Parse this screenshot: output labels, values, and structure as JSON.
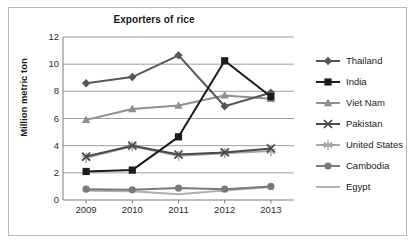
{
  "chart_data": {
    "type": "line",
    "title": "Exporters of rice",
    "xlabel": "",
    "ylabel": "Million metric ton",
    "categories": [
      "2009",
      "2010",
      "2011",
      "2012",
      "2013"
    ],
    "ylim": [
      0,
      12
    ],
    "yticks": [
      0,
      2,
      4,
      6,
      8,
      10,
      12
    ],
    "grid": true,
    "legend_position": "right",
    "series": [
      {
        "name": "Thailand",
        "marker": "diamond",
        "color": "#575757",
        "values": [
          8.6,
          9.05,
          10.65,
          6.9,
          7.9
        ]
      },
      {
        "name": "India",
        "marker": "square",
        "color": "#1c1c1c",
        "values": [
          2.1,
          2.2,
          4.65,
          10.25,
          7.6
        ]
      },
      {
        "name": "Viet Nam",
        "marker": "triangle",
        "color": "#8f8f8f",
        "values": [
          5.9,
          6.7,
          6.95,
          7.7,
          7.45
        ]
      },
      {
        "name": "Pakistan",
        "marker": "x",
        "color": "#4a4a4a",
        "values": [
          3.2,
          4.0,
          3.35,
          3.5,
          3.8
        ]
      },
      {
        "name": "United States",
        "marker": "star",
        "color": "#a6a6a6",
        "values": [
          3.1,
          3.95,
          3.25,
          3.45,
          3.6
        ]
      },
      {
        "name": "Cambodia",
        "marker": "circle",
        "color": "#7a7a7a",
        "values": [
          0.8,
          0.75,
          0.88,
          0.8,
          1.0
        ]
      },
      {
        "name": "Egypt",
        "marker": "none",
        "color": "#b0b0b0",
        "values": [
          0.68,
          0.65,
          0.42,
          0.7,
          0.95
        ]
      }
    ]
  }
}
